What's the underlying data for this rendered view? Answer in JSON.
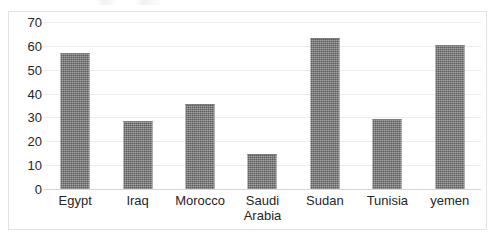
{
  "chart_data": {
    "type": "bar",
    "title": "",
    "xlabel": "",
    "ylabel": "",
    "categories": [
      "Egypt",
      "Iraq",
      "Morocco",
      "Saudi Arabia",
      "Sudan",
      "Tunisia",
      "yemen"
    ],
    "values": [
      57,
      28.5,
      35.5,
      14.5,
      63.5,
      29.5,
      60.5
    ],
    "ylim": [
      0,
      70
    ],
    "ytick_labels": [
      "70",
      "60",
      "50",
      "40",
      "30",
      "20",
      "10",
      "0"
    ],
    "ytick_values": [
      70,
      60,
      50,
      40,
      30,
      20,
      10,
      0
    ],
    "ytick_step": 10,
    "grid": "horizontal",
    "legend": "none",
    "bar_color": "#6f6f6f",
    "bar_fill_pattern": "dithered-checker-gray",
    "gridline_color": "#ebebeb",
    "frame_color": "#e2e2e2",
    "text_color": "#262626",
    "background_color": "#ffffff"
  },
  "axis": {
    "y_ticks": [
      {
        "label": "70",
        "value": 70
      },
      {
        "label": "60",
        "value": 60
      },
      {
        "label": "50",
        "value": 50
      },
      {
        "label": "40",
        "value": 40
      },
      {
        "label": "30",
        "value": 30
      },
      {
        "label": "20",
        "value": 20
      },
      {
        "label": "10",
        "value": 10
      },
      {
        "label": "0",
        "value": 0
      }
    ],
    "x_categories": [
      {
        "label": "Egypt",
        "lines": [
          "Egypt"
        ]
      },
      {
        "label": "Iraq",
        "lines": [
          "Iraq"
        ]
      },
      {
        "label": "Morocco",
        "lines": [
          "Morocco"
        ]
      },
      {
        "label": "Saudi Arabia",
        "lines": [
          "Saudi",
          "Arabia"
        ]
      },
      {
        "label": "Sudan",
        "lines": [
          "Sudan"
        ]
      },
      {
        "label": "Tunisia",
        "lines": [
          "Tunisia"
        ]
      },
      {
        "label": "yemen",
        "lines": [
          "yemen"
        ]
      }
    ]
  }
}
